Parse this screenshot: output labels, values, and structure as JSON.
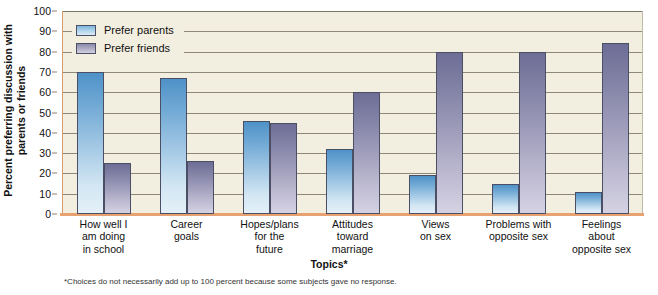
{
  "chart_data": {
    "type": "bar",
    "title": "",
    "xlabel": "Topics*",
    "ylabel": "Percent preferring discussion with parents or friends",
    "ylabel_lines": [
      "Percent preferring discussion with",
      "parents or friends"
    ],
    "ylim": [
      0,
      100
    ],
    "ytick_values": [
      0,
      10,
      20,
      30,
      40,
      50,
      60,
      70,
      80,
      90,
      100
    ],
    "ytick_labels": [
      "0",
      "10",
      "20",
      "30",
      "40",
      "50",
      "60",
      "70",
      "80",
      "90",
      "100"
    ],
    "grid": true,
    "legend_position": "top-left",
    "categories": [
      "How well I am doing in school",
      "Career goals",
      "Hopes/plans for the future",
      "Attitudes toward marriage",
      "Views on sex",
      "Problems with opposite sex",
      "Feelings about opposite sex"
    ],
    "category_label_lines": [
      [
        "How well I",
        "am doing",
        "in school"
      ],
      [
        "Career",
        "goals"
      ],
      [
        "Hopes/plans",
        "for the",
        "future"
      ],
      [
        "Attitudes",
        "toward",
        "marriage"
      ],
      [
        "Views",
        "on sex"
      ],
      [
        "Problems with",
        "opposite sex"
      ],
      [
        "Feelings",
        "about",
        "opposite sex"
      ]
    ],
    "series": [
      {
        "name": "Prefer parents",
        "color": "#7fb6dd",
        "values": [
          70,
          67,
          46,
          32,
          19,
          15,
          11
        ]
      },
      {
        "name": "Prefer friends",
        "color": "#8b8bab",
        "values": [
          25,
          26,
          45,
          60,
          80,
          80,
          84
        ]
      }
    ],
    "annotations": {
      "footnote": "*Choices do not necessarily add up to 100 percent because some subjects gave no response."
    }
  },
  "legend": {
    "items": [
      {
        "label": "Prefer parents"
      },
      {
        "label": "Prefer friends"
      }
    ]
  },
  "colors": {
    "plot_background": "#f2eee0",
    "gridline": "#8d8878",
    "baseline": "#e8a171",
    "parents_bar": "#7fb6dd",
    "friends_bar": "#8b8bab",
    "bar_border": "#4b4f66",
    "text": "#111111"
  }
}
